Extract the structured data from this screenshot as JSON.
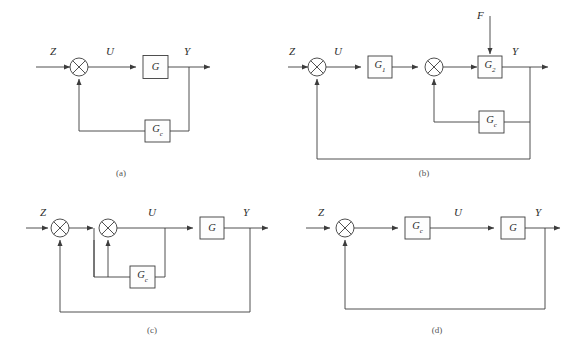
{
  "figure": {
    "background_color": "#ffffff",
    "line_color": "#3c3c3c",
    "block_fill": "#fdfdfd",
    "text_color": "#2b2b2b"
  },
  "diagrams": [
    {
      "id": "a",
      "caption": "(a)",
      "signals": {
        "input": "Z",
        "control": "U",
        "output": "Y"
      },
      "blocks": [
        {
          "name": "plant",
          "label": "G",
          "subscript": ""
        },
        {
          "name": "controller",
          "label": "G",
          "subscript": "c"
        }
      ],
      "summing_junctions": 1,
      "topology": "Z into summing junction, forward path through G to output Y, feedback from Y through Gc back to summing junction"
    },
    {
      "id": "b",
      "caption": "(b)",
      "signals": {
        "input": "Z",
        "control": "U",
        "output": "Y",
        "disturbance": "F"
      },
      "blocks": [
        {
          "name": "plant-1",
          "label": "G",
          "subscript": "1"
        },
        {
          "name": "plant-2",
          "label": "G",
          "subscript": "2"
        },
        {
          "name": "controller",
          "label": "G",
          "subscript": "c"
        }
      ],
      "summing_junctions": 2,
      "topology": "Z into first summing junction, U through G1 into second summing junction, then G2 with disturbance F injected from above, output Y; inner feedback through Gc to second junction, outer feedback from Y to first junction"
    },
    {
      "id": "c",
      "caption": "(c)",
      "signals": {
        "input": "Z",
        "control": "U",
        "output": "Y"
      },
      "blocks": [
        {
          "name": "plant",
          "label": "G",
          "subscript": ""
        },
        {
          "name": "controller",
          "label": "G",
          "subscript": "c"
        }
      ],
      "summing_junctions": 2,
      "topology": "Z into first summing junction, into second summing junction producing U, forward through G to Y; inner loop taps U through Gc back to second junction, outer loop from Y back to first junction"
    },
    {
      "id": "d",
      "caption": "(d)",
      "signals": {
        "input": "Z",
        "control": "U",
        "output": "Y"
      },
      "blocks": [
        {
          "name": "controller",
          "label": "G",
          "subscript": "c"
        },
        {
          "name": "plant",
          "label": "G",
          "subscript": ""
        }
      ],
      "summing_junctions": 1,
      "topology": "Z into summing junction, through Gc producing U, through G to output Y, with unity feedback from Y back to the summing junction"
    }
  ],
  "labels": {
    "a": {
      "Z": "Z",
      "U": "U",
      "Y": "Y",
      "block_G": "G",
      "block_Gc_main": "G",
      "block_Gc_sub": "c",
      "caption": "(a)"
    },
    "b": {
      "U": "U",
      "Y": "Y",
      "F": "F",
      "block_G1_main": "G",
      "block_G1_sub": "1",
      "block_G2_main": "G",
      "block_G2_sub": "2",
      "block_Gc_main": "G",
      "block_Gc_sub": "c",
      "Z": "Z",
      "caption": "(b)"
    },
    "c": {
      "Z": "Z",
      "U": "U",
      "Y": "Y",
      "block_G": "G",
      "block_Gc_main": "G",
      "block_Gc_sub": "c",
      "caption": "(c)"
    },
    "d": {
      "Z": "Z",
      "U": "U",
      "Y": "Y",
      "block_Gc_main": "G",
      "block_Gc_sub": "c",
      "block_G": "G",
      "caption": "(d)"
    }
  }
}
